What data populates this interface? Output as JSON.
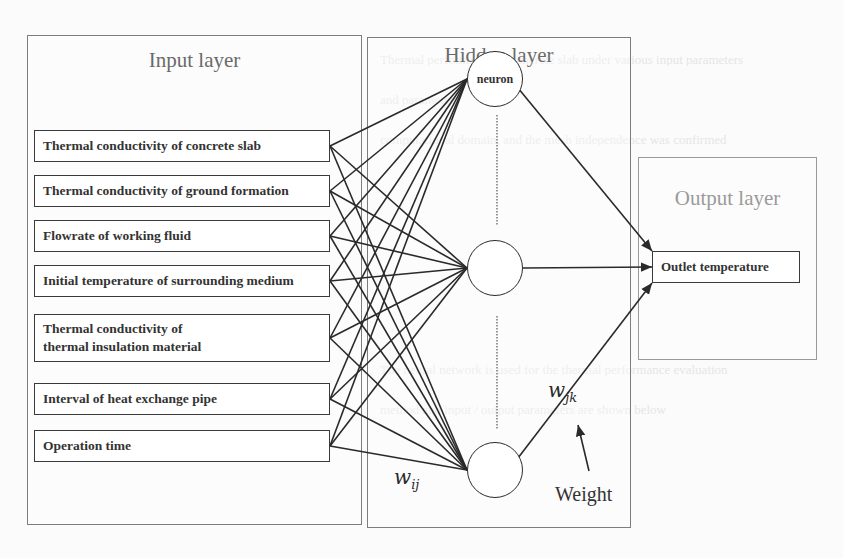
{
  "background_text": {
    "line1": "Thermal performance of concrete slab under various input parameters",
    "line2": "and parameters",
    "line3": "computational domain, and the mesh independence was confirmed",
    "line4": "The neural network is used for the thermal performance evaluation",
    "line5": "method and input / output parameters are shown below"
  },
  "input_layer": {
    "title": "Input layer",
    "inputs": [
      {
        "label": "Thermal conductivity of concrete slab"
      },
      {
        "label": "Thermal conductivity of ground formation"
      },
      {
        "label": "Flowrate of working fluid"
      },
      {
        "label": "Initial temperature of surrounding medium"
      },
      {
        "label_line1": "Thermal conductivity of",
        "label_line2": "thermal insulation material"
      },
      {
        "label": "Interval of heat exchange pipe"
      },
      {
        "label": "Operation time"
      }
    ]
  },
  "hidden_layer": {
    "title": "Hidden layer",
    "neurons": [
      {
        "label": "neuron"
      },
      {
        "label": ""
      },
      {
        "label": ""
      }
    ],
    "weight_input_hidden": "w",
    "weight_input_hidden_sub": "ij",
    "weight_hidden_output": "w",
    "weight_hidden_output_sub": "jk",
    "weight_annotation": "Weight"
  },
  "output_layer": {
    "title": "Output layer",
    "outputs": [
      {
        "label": "Outlet temperature"
      }
    ]
  },
  "colors": {
    "line": "#2a2a2a",
    "panel_border": "#7d7d7d",
    "title_text": "#6a6a6a"
  }
}
